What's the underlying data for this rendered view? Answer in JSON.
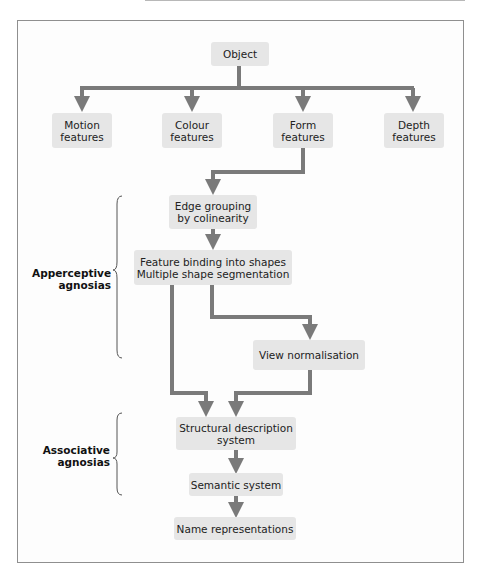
{
  "diagram": {
    "colors": {
      "box_fill": "#e6e6e6",
      "arrow": "#7a7a7a",
      "frame": "#8f8f8f",
      "text": "#222222"
    },
    "nodes": {
      "object": {
        "lines": [
          "Object"
        ]
      },
      "motion": {
        "lines": [
          "Motion",
          "features"
        ]
      },
      "colour": {
        "lines": [
          "Colour",
          "features"
        ]
      },
      "form": {
        "lines": [
          "Form",
          "features"
        ]
      },
      "depth": {
        "lines": [
          "Depth",
          "features"
        ]
      },
      "edge": {
        "lines": [
          "Edge grouping",
          "by colinearity"
        ]
      },
      "binding": {
        "lines": [
          "Feature binding into shapes",
          "Multiple shape segmentation"
        ]
      },
      "view": {
        "lines": [
          "View normalisation"
        ]
      },
      "structural": {
        "lines": [
          "Structural description",
          "system"
        ]
      },
      "semantic": {
        "lines": [
          "Semantic system"
        ]
      },
      "names": {
        "lines": [
          "Name representations"
        ]
      }
    },
    "groups": {
      "apperceptive": {
        "lines": [
          "Apperceptive",
          "agnosias"
        ]
      },
      "associative": {
        "lines": [
          "Associative",
          "agnosias"
        ]
      }
    },
    "edges": [
      [
        "Object",
        "Motion features"
      ],
      [
        "Object",
        "Colour features"
      ],
      [
        "Object",
        "Form features"
      ],
      [
        "Object",
        "Depth features"
      ],
      [
        "Form features",
        "Edge grouping by colinearity"
      ],
      [
        "Edge grouping by colinearity",
        "Feature binding into shapes / Multiple shape segmentation"
      ],
      [
        "Feature binding into shapes / Multiple shape segmentation",
        "View normalisation"
      ],
      [
        "Feature binding into shapes / Multiple shape segmentation",
        "Structural description system"
      ],
      [
        "View normalisation",
        "Structural description system"
      ],
      [
        "Structural description system",
        "Semantic system"
      ],
      [
        "Semantic system",
        "Name representations"
      ]
    ]
  }
}
